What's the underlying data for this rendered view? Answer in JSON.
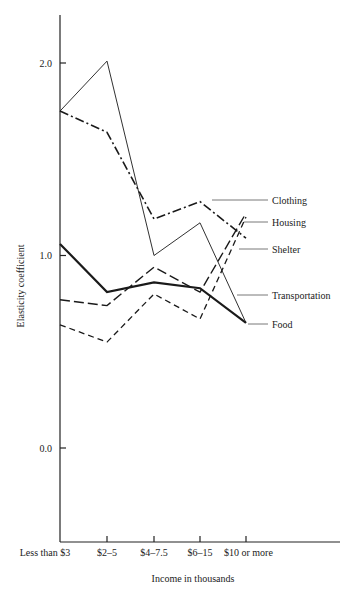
{
  "chart_data": {
    "type": "line",
    "title": "",
    "xlabel": "Income in thousands",
    "ylabel": "Elasticity coefficient",
    "categories": [
      "Less than $3",
      "$2–5",
      "$4–7.5",
      "$6–15",
      "$10 or more"
    ],
    "yticks": [
      "0.0",
      "1.0",
      "2.0"
    ],
    "ylim": [
      -0.5,
      2.25
    ],
    "grid": false,
    "legend_position": "right, direct labels with leader lines",
    "series": [
      {
        "name": "Clothing",
        "style": "dash-dot",
        "values": [
          1.75,
          1.64,
          1.19,
          1.28,
          1.09
        ]
      },
      {
        "name": "Housing",
        "style": "long-dash",
        "values": [
          0.77,
          0.74,
          0.94,
          0.81,
          1.22
        ]
      },
      {
        "name": "Shelter",
        "style": "short-dash",
        "values": [
          0.64,
          0.55,
          0.8,
          0.67,
          1.2
        ]
      },
      {
        "name": "Transportation",
        "style": "thin-solid",
        "values": [
          1.75,
          2.01,
          1.0,
          1.17,
          0.65
        ]
      },
      {
        "name": "Food",
        "style": "thick-solid",
        "values": [
          1.06,
          0.81,
          0.86,
          0.83,
          0.65
        ]
      }
    ]
  }
}
